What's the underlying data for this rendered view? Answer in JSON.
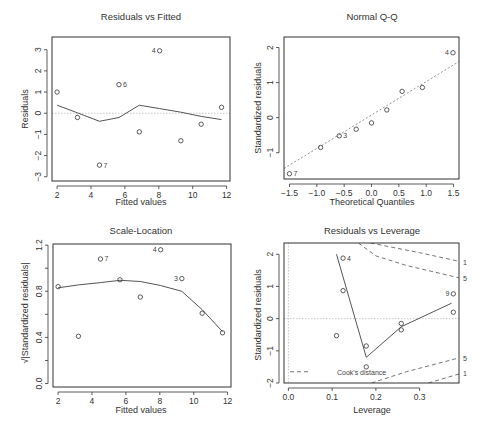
{
  "chart_data": [
    {
      "type": "scatter",
      "title": "Residuals vs Fitted",
      "xlabel": "Fitted values",
      "ylabel": "Residuals",
      "xlim": [
        1.7,
        12.2
      ],
      "ylim": [
        -3.2,
        3.6
      ],
      "xticks": [
        2,
        4,
        6,
        8,
        10,
        12
      ],
      "yticks": [
        -3,
        -2,
        -1,
        0,
        1,
        2,
        3
      ],
      "reference_line": {
        "y": 0,
        "style": "dotted"
      },
      "points": [
        {
          "x": 2.0,
          "y": 1.0
        },
        {
          "x": 3.2,
          "y": -0.2
        },
        {
          "x": 4.5,
          "y": -2.45,
          "label": "7"
        },
        {
          "x": 5.65,
          "y": 1.35,
          "label": "6"
        },
        {
          "x": 6.85,
          "y": -0.88
        },
        {
          "x": 8.05,
          "y": 2.95,
          "label": "4"
        },
        {
          "x": 9.3,
          "y": -1.3
        },
        {
          "x": 10.5,
          "y": -0.52
        },
        {
          "x": 11.7,
          "y": 0.28
        }
      ],
      "smoother": [
        {
          "x": 2.0,
          "y": 0.38
        },
        {
          "x": 3.2,
          "y": 0.02
        },
        {
          "x": 4.5,
          "y": -0.38
        },
        {
          "x": 5.65,
          "y": -0.2
        },
        {
          "x": 6.85,
          "y": 0.38
        },
        {
          "x": 8.05,
          "y": 0.22
        },
        {
          "x": 9.3,
          "y": 0.05
        },
        {
          "x": 10.5,
          "y": -0.15
        },
        {
          "x": 11.7,
          "y": -0.3
        }
      ]
    },
    {
      "type": "scatter",
      "title": "Normal Q-Q",
      "xlabel": "Theoretical Quantiles",
      "ylabel": "Standardized residuals",
      "xlim": [
        -1.6,
        1.6
      ],
      "ylim": [
        -1.75,
        2.3
      ],
      "xticks": [
        -1.5,
        -1.0,
        -0.5,
        0.0,
        0.5,
        1.0,
        1.5
      ],
      "ytick_labels": [
        "-1",
        "0",
        "1",
        "2"
      ],
      "yticks": [
        -1,
        0,
        1,
        2
      ],
      "reference_line": {
        "x1": -1.6,
        "y1": -1.45,
        "x2": 1.6,
        "y2": 1.6,
        "style": "dotted"
      },
      "points": [
        {
          "x": -1.5,
          "y": -1.6,
          "label": "7"
        },
        {
          "x": -0.93,
          "y": -0.85
        },
        {
          "x": -0.59,
          "y": -0.52,
          "label": "3"
        },
        {
          "x": -0.28,
          "y": -0.33
        },
        {
          "x": 0.0,
          "y": -0.15
        },
        {
          "x": 0.28,
          "y": 0.22
        },
        {
          "x": 0.56,
          "y": 0.75
        },
        {
          "x": 0.93,
          "y": 0.86
        },
        {
          "x": 1.49,
          "y": 1.85,
          "label": "4"
        }
      ]
    },
    {
      "type": "scatter",
      "title": "Scale-Location",
      "xlabel": "Fitted values",
      "ylabel": "√|Standardized residuals|",
      "xlim": [
        1.7,
        12.2
      ],
      "ylim": [
        -0.03,
        1.21
      ],
      "xticks": [
        2,
        4,
        6,
        8,
        10,
        12
      ],
      "yticks": [
        0.0,
        0.4,
        0.8,
        1.2
      ],
      "ytick_labels": [
        "0.0",
        "0.4",
        "0.8",
        "1.2"
      ],
      "points": [
        {
          "x": 2.0,
          "y": 0.84
        },
        {
          "x": 3.2,
          "y": 0.41
        },
        {
          "x": 4.5,
          "y": 1.08,
          "label": "7"
        },
        {
          "x": 5.65,
          "y": 0.9
        },
        {
          "x": 6.85,
          "y": 0.75
        },
        {
          "x": 8.05,
          "y": 1.16,
          "label": "4"
        },
        {
          "x": 9.3,
          "y": 0.91,
          "label": "3"
        },
        {
          "x": 10.5,
          "y": 0.61
        },
        {
          "x": 11.7,
          "y": 0.44
        }
      ],
      "smoother": [
        {
          "x": 2.0,
          "y": 0.83
        },
        {
          "x": 3.2,
          "y": 0.855
        },
        {
          "x": 4.5,
          "y": 0.875
        },
        {
          "x": 5.65,
          "y": 0.895
        },
        {
          "x": 6.85,
          "y": 0.885
        },
        {
          "x": 8.05,
          "y": 0.85
        },
        {
          "x": 9.3,
          "y": 0.8
        },
        {
          "x": 10.5,
          "y": 0.64
        },
        {
          "x": 11.7,
          "y": 0.45
        }
      ]
    },
    {
      "type": "scatter",
      "title": "Residuals vs Leverage",
      "xlabel": "Leverage",
      "ylabel": "Standardized residuals",
      "xlim": [
        -0.01,
        0.39
      ],
      "ylim": [
        -2.0,
        2.35
      ],
      "xticks": [
        0.0,
        0.1,
        0.2,
        0.3
      ],
      "xtick_labels": [
        "0.0",
        "0.1",
        "0.2",
        "0.3"
      ],
      "yticks": [
        -2,
        -1,
        0,
        1,
        2
      ],
      "reference_lines": [
        {
          "y": 0,
          "style": "dotted"
        },
        {
          "x": 0,
          "style": "dotted"
        }
      ],
      "points": [
        {
          "x": 0.11,
          "y": -0.53
        },
        {
          "x": 0.125,
          "y": 1.88,
          "label": "4"
        },
        {
          "x": 0.125,
          "y": 0.87
        },
        {
          "x": 0.178,
          "y": -0.85
        },
        {
          "x": 0.178,
          "y": -1.5
        },
        {
          "x": 0.258,
          "y": -0.15
        },
        {
          "x": 0.258,
          "y": -0.35
        },
        {
          "x": 0.377,
          "y": 0.77,
          "label": "9"
        },
        {
          "x": 0.377,
          "y": 0.2
        }
      ],
      "smoother": [
        {
          "x": 0.11,
          "y": 2.0
        },
        {
          "x": 0.178,
          "y": -1.2
        },
        {
          "x": 0.258,
          "y": -0.25
        },
        {
          "x": 0.373,
          "y": 0.48
        }
      ],
      "cooks_contours": [
        {
          "level": "1",
          "side": "upper",
          "points": [
            {
              "x": 0.188,
              "y": 2.35
            },
            {
              "x": 0.3,
              "y": 2.05
            },
            {
              "x": 0.39,
              "y": 1.78
            }
          ]
        },
        {
          "level": "0.5",
          "side": "upper",
          "points": [
            {
              "x": 0.16,
              "y": 2.35
            },
            {
              "x": 0.2,
              "y": 1.95
            },
            {
              "x": 0.27,
              "y": 1.65
            },
            {
              "x": 0.39,
              "y": 1.27
            }
          ]
        },
        {
          "level": "0.5",
          "side": "lower",
          "points": [
            {
              "x": 0.19,
              "y": -2.0
            },
            {
              "x": 0.27,
              "y": -1.65
            },
            {
              "x": 0.39,
              "y": -1.22
            }
          ]
        },
        {
          "level": "1",
          "side": "lower",
          "points": [
            {
              "x": 0.32,
              "y": -2.0
            },
            {
              "x": 0.39,
              "y": -1.72
            }
          ]
        }
      ],
      "contour_labels": [
        {
          "text": "1",
          "y": 1.75
        },
        {
          "text": "5",
          "y": 1.27
        },
        {
          "text": "5",
          "y": -1.22
        },
        {
          "text": "1",
          "y": -1.68
        }
      ],
      "legend": {
        "label": "Cook's distance",
        "position": "bottomleft"
      }
    }
  ],
  "panels": {
    "p1": {
      "title": "Residuals vs Fitted",
      "xlabel": "Fitted values",
      "ylabel": "Residuals"
    },
    "p2": {
      "title": "Normal Q-Q",
      "xlabel": "Theoretical Quantiles",
      "ylabel": "Standardized residuals"
    },
    "p3": {
      "title": "Scale-Location",
      "xlabel": "Fitted values",
      "ylabel": "√|Standardized residuals|"
    },
    "p4": {
      "title": "Residuals vs Leverage",
      "xlabel": "Leverage",
      "ylabel": "Standardized residuals",
      "legend": "Cook's distance"
    }
  },
  "colors": {
    "axis": "#333333",
    "points": "#333333",
    "smoother": "#555555",
    "reference": "#bbbbbb",
    "cooks": "#666666"
  }
}
